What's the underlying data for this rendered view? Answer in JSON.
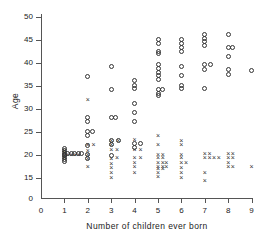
{
  "chart_data": {
    "type": "scatter",
    "title": "",
    "xlabel": "Number of children ever born",
    "ylabel": "Age",
    "xlim": [
      0,
      9
    ],
    "ylim": [
      13,
      50
    ],
    "grid": false,
    "legend": "none",
    "xticks": [
      "0",
      "1",
      "2",
      "3",
      "4",
      "5",
      "6",
      "7",
      "8",
      "9"
    ],
    "yticks": [
      "15",
      "20",
      "25",
      "30",
      "35",
      "40",
      "45",
      "50"
    ],
    "y_axis_break_label": "0",
    "marker_types": [
      "circle",
      "cross"
    ],
    "series": [
      {
        "name": "circle",
        "marker": "circle",
        "points": [
          [
            1,
            21.5
          ],
          [
            1,
            21.0
          ],
          [
            1,
            20.6
          ],
          [
            1,
            20.2
          ],
          [
            1,
            19.8
          ],
          [
            1,
            19.4
          ],
          [
            1,
            19.0
          ],
          [
            1,
            18.6
          ],
          [
            1.15,
            20.4
          ],
          [
            1.3,
            20.4
          ],
          [
            1.45,
            20.4
          ],
          [
            1.6,
            20.4
          ],
          [
            1.75,
            20.4
          ],
          [
            2,
            37.0
          ],
          [
            2,
            28.2
          ],
          [
            2,
            27.2
          ],
          [
            2,
            25.2
          ],
          [
            2.2,
            25.2
          ],
          [
            2,
            24.2
          ],
          [
            2,
            22.0
          ],
          [
            2,
            20.2
          ],
          [
            2,
            19.2
          ],
          [
            3,
            39.2
          ],
          [
            3,
            34.2
          ],
          [
            3,
            28.2
          ],
          [
            3.2,
            28.2
          ],
          [
            3,
            23.2
          ],
          [
            3,
            22.2
          ],
          [
            3.3,
            23.2
          ],
          [
            3,
            20.0
          ],
          [
            4,
            36.2
          ],
          [
            4,
            35.2
          ],
          [
            4,
            34.4
          ],
          [
            4,
            31.2
          ],
          [
            4,
            29.2
          ],
          [
            4,
            27.2
          ],
          [
            4,
            22.6
          ],
          [
            4.25,
            22.6
          ],
          [
            4,
            21.6
          ],
          [
            5,
            45.2
          ],
          [
            5,
            44.2
          ],
          [
            5,
            42.6
          ],
          [
            5,
            42.0
          ],
          [
            5,
            39.6
          ],
          [
            5,
            38.8
          ],
          [
            5,
            38.0
          ],
          [
            5,
            37.2
          ],
          [
            5,
            36.4
          ],
          [
            5,
            34.2
          ],
          [
            5.2,
            34.2
          ],
          [
            5,
            33.4
          ],
          [
            5,
            33.0
          ],
          [
            6,
            45.2
          ],
          [
            6,
            44.2
          ],
          [
            6,
            43.4
          ],
          [
            6,
            42.6
          ],
          [
            6,
            39.2
          ],
          [
            6,
            37.2
          ],
          [
            6,
            35.2
          ],
          [
            6,
            34.4
          ],
          [
            7,
            46.2
          ],
          [
            7,
            45.4
          ],
          [
            7,
            44.6
          ],
          [
            7,
            43.8
          ],
          [
            7,
            39.6
          ],
          [
            7.25,
            39.6
          ],
          [
            7,
            38.6
          ],
          [
            7,
            34.4
          ],
          [
            8,
            46.2
          ],
          [
            8,
            43.4
          ],
          [
            8.2,
            43.4
          ],
          [
            8,
            41.4
          ],
          [
            8,
            38.6
          ],
          [
            8,
            37.6
          ],
          [
            9,
            38.4
          ]
        ]
      },
      {
        "name": "cross",
        "marker": "cross",
        "points": [
          [
            1,
            21.0
          ],
          [
            1,
            20.5
          ],
          [
            1,
            20.0
          ],
          [
            1,
            19.5
          ],
          [
            1.15,
            20.2
          ],
          [
            1.3,
            20.2
          ],
          [
            1.45,
            20.2
          ],
          [
            1.6,
            20.2
          ],
          [
            2,
            32.0
          ],
          [
            2,
            22.2
          ],
          [
            2.25,
            22.2
          ],
          [
            2,
            21.0
          ],
          [
            2,
            20.2
          ],
          [
            2,
            19.2
          ],
          [
            2,
            17.4
          ],
          [
            3,
            23.2
          ],
          [
            3.3,
            23.2
          ],
          [
            3,
            22.2
          ],
          [
            3,
            21.2
          ],
          [
            3.25,
            21.2
          ],
          [
            3,
            19.2
          ],
          [
            3.25,
            19.4
          ],
          [
            3,
            18.2
          ],
          [
            3,
            17.2
          ],
          [
            3,
            16.2
          ],
          [
            3,
            15.2
          ],
          [
            4,
            23.4
          ],
          [
            4,
            21.2
          ],
          [
            4.25,
            21.2
          ],
          [
            4,
            19.4
          ],
          [
            4.25,
            19.4
          ],
          [
            4,
            18.4
          ],
          [
            4,
            17.4
          ],
          [
            4,
            16.2
          ],
          [
            5,
            24.2
          ],
          [
            5,
            22.2
          ],
          [
            5,
            20.2
          ],
          [
            5.2,
            20.2
          ],
          [
            5,
            19.4
          ],
          [
            5.2,
            19.4
          ],
          [
            5,
            18.4
          ],
          [
            5.2,
            18.4
          ],
          [
            5.35,
            18.4
          ],
          [
            5,
            17.6
          ],
          [
            5.2,
            17.6
          ],
          [
            5.35,
            17.6
          ],
          [
            5,
            17.0
          ],
          [
            5.2,
            17.0
          ],
          [
            5,
            16.2
          ],
          [
            5,
            15.4
          ],
          [
            6,
            23.2
          ],
          [
            6,
            22.2
          ],
          [
            6,
            20.2
          ],
          [
            6,
            19.4
          ],
          [
            6,
            18.4
          ],
          [
            6.2,
            18.4
          ],
          [
            6,
            17.2
          ],
          [
            6,
            16.2
          ],
          [
            6,
            15.2
          ],
          [
            7,
            20.4
          ],
          [
            7.2,
            20.4
          ],
          [
            7,
            19.4
          ],
          [
            7.2,
            19.4
          ],
          [
            7.4,
            19.4
          ],
          [
            7.6,
            19.4
          ],
          [
            7,
            16.2
          ],
          [
            7,
            14.4
          ],
          [
            8,
            20.4
          ],
          [
            8.2,
            20.4
          ],
          [
            8,
            19.4
          ],
          [
            8.2,
            19.4
          ],
          [
            8,
            18.4
          ],
          [
            8,
            17.4
          ],
          [
            8.2,
            17.4
          ],
          [
            9,
            17.4
          ]
        ]
      }
    ]
  }
}
